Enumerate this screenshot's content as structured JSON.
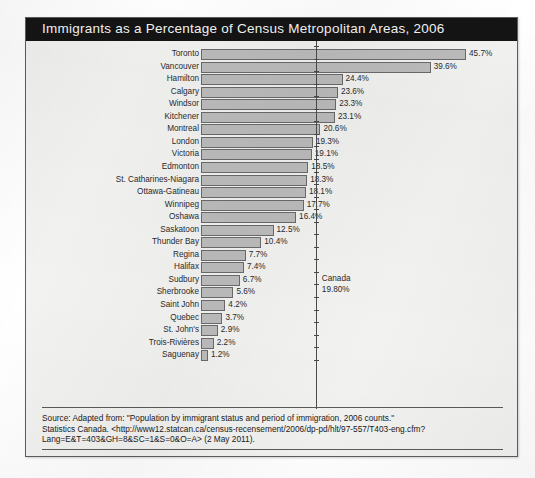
{
  "figure": {
    "title": "Immigrants as a Percentage of Census Metropolitan Areas, 2006",
    "title_bar_color": "#141414",
    "panel_background": "#f2f2f1",
    "bar_fill_color": "#bcbcbc",
    "bar_border_color": "#6a6a6a"
  },
  "annotation": {
    "name": "Canada",
    "value_label": "19.80%",
    "value": 19.8
  },
  "source": {
    "line1": "Source: Adapted from: \"Population by immigrant status and period of immigration, 2006 counts.\"",
    "line2": "Statistics Canada. <http://www12.statcan.ca/census-recensement/2006/dp-pd/hlt/97-557/T403-eng.cfm?",
    "line3": "Lang=E&T=403&GH=8&SC=1&S=0&O=A> (2 May 2011)."
  },
  "chart_data": {
    "type": "bar",
    "orientation": "horizontal",
    "title": "Immigrants as a Percentage of Census Metropolitan Areas, 2006",
    "xlabel": "",
    "ylabel": "",
    "xlim": [
      0,
      50
    ],
    "grid": false,
    "legend": "none",
    "value_suffix": "%",
    "reference_line": {
      "label": "Canada",
      "value": 19.8,
      "value_label": "19.80%"
    },
    "categories": [
      "Toronto",
      "Vancouver",
      "Hamilton",
      "Calgary",
      "Windsor",
      "Kitchener",
      "Montreal",
      "London",
      "Victoria",
      "Edmonton",
      "St. Catharines-Niagara",
      "Ottawa-Gatineau",
      "Winnipeg",
      "Oshawa",
      "Saskatoon",
      "Thunder Bay",
      "Regina",
      "Halifax",
      "Sudbury",
      "Sherbrooke",
      "Saint John",
      "Quebec",
      "St. John's",
      "Trois-Rivières",
      "Saguenay"
    ],
    "values": [
      45.7,
      39.6,
      24.4,
      23.6,
      23.3,
      23.1,
      20.6,
      19.3,
      19.1,
      18.5,
      18.3,
      18.1,
      17.7,
      16.4,
      12.5,
      10.4,
      7.7,
      7.4,
      6.7,
      5.6,
      4.2,
      3.7,
      2.9,
      2.2,
      1.2
    ],
    "value_labels": [
      "45.7%",
      "39.6%",
      "24.4%",
      "23.6%",
      "23.3%",
      "23.1%",
      "20.6%",
      "19.3%",
      "19.1%",
      "18.5%",
      "18.3%",
      "18.1%",
      "17.7%",
      "16.4%",
      "12.5%",
      "10.4%",
      "7.7%",
      "7.4%",
      "6.7%",
      "5.6%",
      "4.2%",
      "3.7%",
      "2.9%",
      "2.2%",
      "1.2%"
    ]
  }
}
